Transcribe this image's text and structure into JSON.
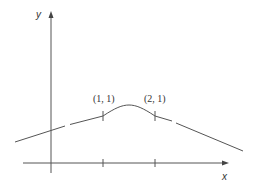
{
  "figure": {
    "axes": {
      "x_label": "x",
      "y_label": "y"
    },
    "points": [
      {
        "label": "(1, 1)",
        "x": 1,
        "y": 1
      },
      {
        "label": "(2, 1)",
        "x": 2,
        "y": 1
      }
    ],
    "colors": {
      "line": "#555555",
      "axis": "#444444",
      "text": "#333333"
    }
  }
}
